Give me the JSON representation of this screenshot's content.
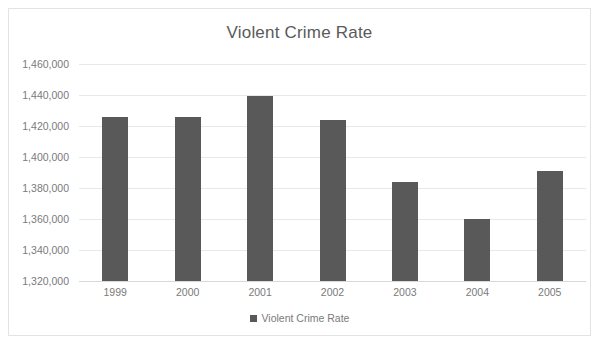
{
  "chart_data": {
    "type": "bar",
    "title": "Violent Crime Rate",
    "xlabel": "",
    "ylabel": "",
    "categories": [
      "1999",
      "2000",
      "2001",
      "2002",
      "2003",
      "2004",
      "2005"
    ],
    "values": [
      1426000,
      1425500,
      1439500,
      1423700,
      1383600,
      1360000,
      1390700
    ],
    "series": [
      {
        "name": "Violent Crime Rate",
        "values": [
          1426000,
          1425500,
          1439500,
          1423700,
          1383600,
          1360000,
          1390700
        ]
      }
    ],
    "ylim": [
      1320000,
      1460000
    ],
    "ytick_step": 20000,
    "ytick_labels": [
      "1,460,000",
      "1,440,000",
      "1,420,000",
      "1,400,000",
      "1,380,000",
      "1,360,000",
      "1,340,000",
      "1,320,000"
    ],
    "ytick_values": [
      1460000,
      1440000,
      1420000,
      1400000,
      1380000,
      1360000,
      1340000,
      1320000
    ],
    "grid": true,
    "legend_position": "bottom",
    "legend": [
      "Violent Crime Rate"
    ],
    "bar_color": "#595959",
    "grid_color": "#e8e8e8",
    "text_color": "#7a7a7a",
    "title_color": "#5a5a5a",
    "frame_color": "#e3e3e3"
  },
  "legend": {
    "entry_label": "Violent Crime Rate"
  }
}
